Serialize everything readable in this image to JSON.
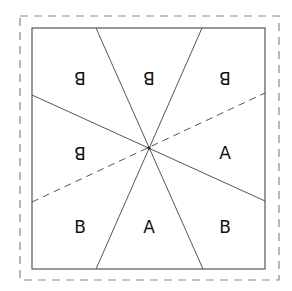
{
  "diagram": {
    "regions": [
      {
        "id": "top-left",
        "label": "B",
        "x": 80,
        "y": 78,
        "mirrored": true
      },
      {
        "id": "top-center",
        "label": "B",
        "x": 149,
        "y": 78,
        "mirrored": true
      },
      {
        "id": "top-right",
        "label": "B",
        "x": 225,
        "y": 78,
        "mirrored": true
      },
      {
        "id": "mid-left",
        "label": "B",
        "x": 80,
        "y": 153,
        "mirrored": true
      },
      {
        "id": "mid-right",
        "label": "A",
        "x": 225,
        "y": 153,
        "mirrored": false
      },
      {
        "id": "bottom-left",
        "label": "B",
        "x": 80,
        "y": 227,
        "mirrored": false
      },
      {
        "id": "bottom-center",
        "label": "A",
        "x": 149,
        "y": 227,
        "mirrored": false
      },
      {
        "id": "bottom-right",
        "label": "B",
        "x": 225,
        "y": 227,
        "mirrored": false
      }
    ],
    "colors": {
      "line": "#555555",
      "dash": "#777777",
      "text": "#111111"
    }
  }
}
